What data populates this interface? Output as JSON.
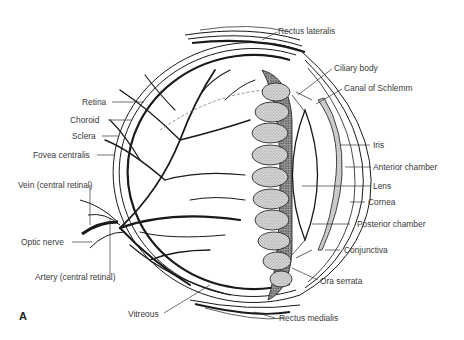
{
  "figure": {
    "panel_letter": "A"
  },
  "labels": {
    "rectus_lateralis": "Rectus lateralis",
    "ciliary_body": "Ciliary body",
    "canal_of_schlemm": "Canal of Schlemm",
    "iris": "Iris",
    "anterior_chamber": "Anterior chamber",
    "lens": "Lens",
    "cornea": "Cornea",
    "posterior_chamber": "Posterior chamber",
    "conjunctiva": "Conjunctiva",
    "ora_serrata": "Ora serrata",
    "rectus_medialis": "Rectus medialis",
    "vitreous": "Vitreous",
    "retina": "Retina",
    "choroid": "Choroid",
    "sclera": "Sclera",
    "fovea_centralis": "Fovea centralis",
    "vein_central_retinal": "Vein (central retinal)",
    "optic_nerve": "Optic nerve",
    "artery_central_retinal": "Artery (central retinal)"
  },
  "colors": {
    "ink": "#1a1a1a",
    "label_text": "#3a3a3a",
    "stipple": "#b8b8b8",
    "background": "#ffffff"
  }
}
